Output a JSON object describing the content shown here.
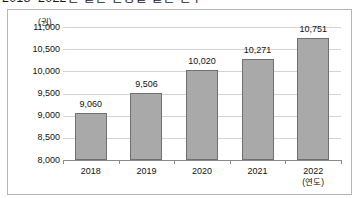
{
  "title": "2018~2022년 일반 연령별 일반 인구",
  "chart_data": {
    "type": "bar",
    "title": "2018~2022년 일반 연령별 일반 인구",
    "categories": [
      "2018",
      "2019",
      "2020",
      "2021",
      "2022"
    ],
    "values": [
      9060,
      9506,
      10020,
      10271,
      10751
    ],
    "value_labels": [
      "9,060",
      "9,506",
      "10,020",
      "10,271",
      "10,751"
    ],
    "xlabel": "(연도)",
    "ylabel": "(권)",
    "ylim": [
      8000,
      11000
    ],
    "yticks": [
      11000,
      10500,
      10000,
      9500,
      9000,
      8500,
      8000
    ],
    "ytick_labels": [
      "11,000",
      "10,500",
      "10,000",
      "9,500",
      "9,000",
      "8,500",
      "8,000"
    ],
    "grid": true,
    "legend": false,
    "bar_color": "#a9a9a9",
    "bar_border_color": "#6f6f6f",
    "gridline_color": "#d3d3d3",
    "axis_color": "#8a8a8a",
    "frame_color": "#b5b5b5"
  }
}
